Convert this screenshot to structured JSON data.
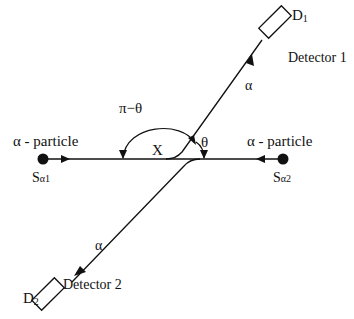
{
  "diagram": {
    "type": "alpha-particle scattering / two-detector geometry",
    "labels": {
      "detector1_symbol": "D",
      "detector1_sub": "1",
      "detector1_name": "Detector 1",
      "detector2_symbol": "D",
      "detector2_sub": "2",
      "detector2_name": "Detector 2",
      "alpha_upper": "α",
      "alpha_lower": "α",
      "particle_left": "α - particle",
      "particle_right": "α - particle",
      "source1_main": "S",
      "source1_sub": "α1",
      "source2_main": "S",
      "source2_sub": "α2",
      "intersection": "X",
      "angle_large": "π−θ",
      "angle_small": "θ"
    },
    "colors": {
      "line": "#111111",
      "background": "#ffffff"
    }
  }
}
